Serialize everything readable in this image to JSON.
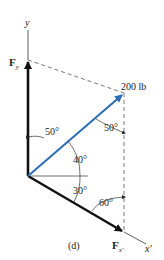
{
  "diagram": {
    "caption": "(d)",
    "axes": {
      "y_label": "y",
      "x_prime_label": "x'"
    },
    "forces": {
      "applied": {
        "label": "200 lb",
        "color": "#2a6db5"
      },
      "fy": {
        "label": "F",
        "subscript": "y"
      },
      "fx": {
        "label": "F",
        "subscript": "x'"
      }
    },
    "angles": {
      "a1": "50°",
      "a2": "50°",
      "a3": "40°",
      "a4": "30°",
      "a5": "60°"
    }
  }
}
